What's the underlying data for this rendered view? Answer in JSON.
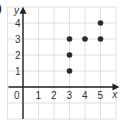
{
  "part_label": ")",
  "chart_data": {
    "type": "scatter",
    "title": "",
    "xlabel": "x",
    "ylabel": "y",
    "x_ticks": [
      "0",
      "1",
      "2",
      "3",
      "4",
      "5"
    ],
    "y_ticks": [
      "1",
      "2",
      "3",
      "4"
    ],
    "xlim": [
      -1,
      6
    ],
    "ylim": [
      -2,
      5
    ],
    "grid": true,
    "points": [
      {
        "x": 3,
        "y": 1
      },
      {
        "x": 3,
        "y": 2
      },
      {
        "x": 3,
        "y": 3
      },
      {
        "x": 4,
        "y": 3
      },
      {
        "x": 5,
        "y": 3
      },
      {
        "x": 5,
        "y": 4
      }
    ],
    "colors": {
      "point": "#2a2a2a",
      "axis": "#222222",
      "grid": "#d8d8d8"
    }
  }
}
